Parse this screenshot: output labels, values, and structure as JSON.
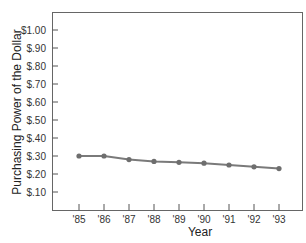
{
  "chart_data": {
    "type": "line",
    "title": "",
    "xlabel": "Year",
    "ylabel": "Purchasing Power of the Dollar",
    "categories": [
      "'85",
      "'86",
      "'87",
      "'88",
      "'89",
      "'90",
      "'91",
      "'92",
      "'93"
    ],
    "series": [
      {
        "name": "Purchasing Power of the Dollar",
        "values": [
          0.3,
          0.3,
          0.28,
          0.27,
          0.265,
          0.26,
          0.25,
          0.24,
          0.23
        ],
        "color": "#7a7a7a"
      }
    ],
    "y_ticks": [
      "$1.00",
      "$.90",
      "$.80",
      "$.70",
      "$.60",
      "$.50",
      "$.40",
      "$.30",
      "$.20",
      "$.10"
    ],
    "y_tick_values": [
      1.0,
      0.9,
      0.8,
      0.7,
      0.6,
      0.5,
      0.4,
      0.3,
      0.2,
      0.1
    ],
    "ylim": [
      0,
      1.1
    ],
    "grid": false,
    "legend": "none"
  }
}
